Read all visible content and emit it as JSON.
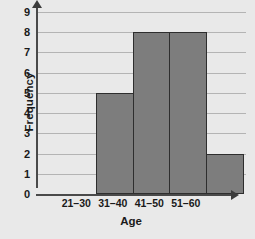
{
  "chart_data": {
    "type": "bar",
    "title": "",
    "xlabel": "Age",
    "ylabel": "Frequency",
    "categories": [
      "21–30",
      "31–40",
      "41–50",
      "51–60"
    ],
    "values": [
      5,
      8,
      8,
      2
    ],
    "ylim": [
      0,
      9
    ],
    "yticks": [
      "0",
      "1",
      "2",
      "3",
      "4",
      "5",
      "6",
      "7",
      "8",
      "9"
    ],
    "grid": "horizontal",
    "legend": "none",
    "colors": {
      "bar_fill": "#7d7d7d",
      "bar_edge": "#2e2e2e",
      "gridline": "#b4b4b4",
      "axis": "#4a4a4a",
      "background": "#e9e9e9",
      "plot_background": "#f0f0f0",
      "text": "#1a1a1a"
    }
  }
}
